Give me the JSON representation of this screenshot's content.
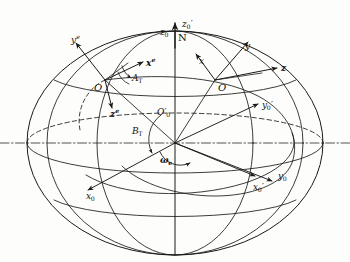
{
  "figure": {
    "type": "technical-diagram",
    "background_color": "#fdfdfb",
    "line_color": "#1a1a1a"
  },
  "labels": {
    "pole_north": "N",
    "polar_axis_z0": "z",
    "polar_axis_z0_sub": "0",
    "polar_axis_z0prime": "z",
    "polar_axis_z0prime_sub": "0",
    "polar_axis_z0prime_mark": "′",
    "station_left": "O",
    "station_right": "O",
    "center_origin": "O",
    "center_origin_sub": "0",
    "center_origin_mark": "′",
    "axis_ye": "y",
    "axis_ye_sup": "e",
    "axis_xe": "x",
    "axis_xe_sup": "e",
    "axis_ze": "z",
    "axis_ze_sup": "e",
    "axis_x": "x",
    "axis_y": "y",
    "axis_z": "z",
    "axis_x0": "x",
    "axis_x0_sub": "0",
    "axis_y0": "y",
    "axis_y0_sub": "0",
    "axis_x0prime": "x",
    "axis_x0prime_sub": "0",
    "axis_x0prime_mark": "′",
    "axis_y0prime": "y",
    "axis_y0prime_sub": "0",
    "axis_y0prime_mark": "′",
    "angle_azimuth": "A",
    "angle_azimuth_sub": "T",
    "angle_elevation": "B",
    "angle_elevation_sub": "T",
    "earth_rate": "ω",
    "earth_rate_sub": "e"
  },
  "geometry": {
    "ellipse_center_x": 175,
    "ellipse_center_y": 143,
    "ellipse_rx": 148,
    "ellipse_ry": 112,
    "equator_dashdot_y": 143,
    "pole_top_y": 22,
    "pole_bottom_y": 255,
    "station_left_point": [
      105,
      80
    ],
    "station_right_point": [
      215,
      80
    ],
    "center_point": [
      175,
      143
    ]
  }
}
